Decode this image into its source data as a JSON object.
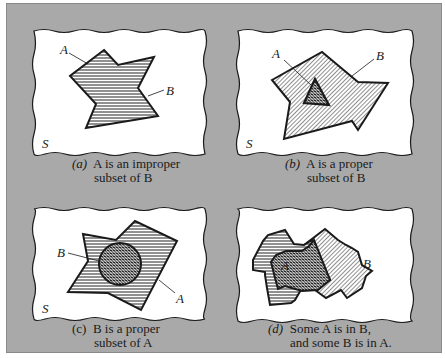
{
  "figure": {
    "panels": [
      {
        "id": "a",
        "set_labels": [
          "A",
          "B"
        ],
        "universe_label": "S",
        "caption": {
          "marker": "(a)",
          "line1": "A is an improper",
          "line2": "subset of B"
        },
        "relation": "A is an improper subset of B (A = B)"
      },
      {
        "id": "b",
        "set_labels": [
          "A",
          "B"
        ],
        "universe_label": "S",
        "caption": {
          "marker": "(b)",
          "line1": "A is a proper",
          "line2": "subset of B"
        },
        "relation": "A is a proper subset of B"
      },
      {
        "id": "c",
        "set_labels": [
          "B",
          "A"
        ],
        "universe_label": "S",
        "caption": {
          "marker": "(c)",
          "line1": "B is a proper",
          "line2": "subset of A"
        },
        "relation": "B is a proper subset of A"
      },
      {
        "id": "d",
        "set_labels": [
          "A",
          "B"
        ],
        "universe_label": "S",
        "caption": {
          "marker": "(d)",
          "line1": "Some A is in B,",
          "line2": "and some B is in A."
        },
        "relation": "A and B partially overlap"
      }
    ],
    "colors": {
      "background_panel": "#a9a9a9",
      "universe_fill": "#ffffff",
      "outline": "#1a1a1a"
    }
  }
}
